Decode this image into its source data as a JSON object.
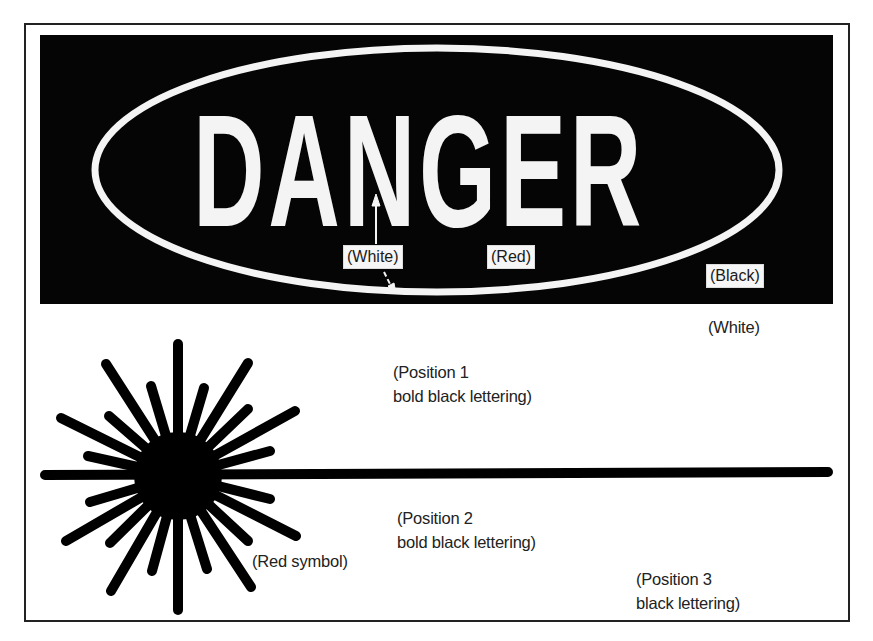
{
  "sign": {
    "signal_word": "DANGER",
    "panel_background_color": "#050505",
    "signal_word_color": "#f4f4f4",
    "color_labels": {
      "letters": "(White)",
      "ellipse": "(Red)",
      "panel": "(Black)",
      "sign_body": "(White)"
    }
  },
  "symbol": {
    "name": "laser-starburst",
    "label": "(Red symbol)"
  },
  "text_positions": [
    {
      "line1": "(Position 1",
      "line2": "bold black lettering)"
    },
    {
      "line1": "(Position 2",
      "line2": "bold black lettering)"
    },
    {
      "line1": "(Position 3",
      "line2": "black lettering)"
    }
  ]
}
